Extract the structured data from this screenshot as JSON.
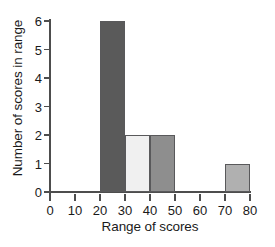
{
  "chart_data": {
    "type": "bar",
    "title": "",
    "xlabel": "Range of scores",
    "ylabel": "Number of scores in range",
    "xlim": [
      0,
      80
    ],
    "ylim": [
      0,
      6
    ],
    "grid": false,
    "legend": null,
    "xticks": [
      0,
      10,
      20,
      30,
      40,
      50,
      60,
      70,
      80
    ],
    "yticks": [
      0,
      1,
      2,
      3,
      4,
      5,
      6
    ],
    "bin_width": 10,
    "categories": [
      "0-10",
      "10-20",
      "20-30",
      "30-40",
      "40-50",
      "50-60",
      "60-70",
      "70-80"
    ],
    "values": [
      0,
      0,
      6,
      2,
      2,
      0,
      0,
      1
    ],
    "bars": [
      {
        "label": "20-30",
        "x0": 20,
        "x1": 30,
        "value": 6,
        "color": "#5a5a5a"
      },
      {
        "label": "30-40",
        "x0": 30,
        "x1": 40,
        "value": 2,
        "color": "#f0f0f0"
      },
      {
        "label": "40-50",
        "x0": 40,
        "x1": 50,
        "value": 2,
        "color": "#8e8e8e"
      },
      {
        "label": "70-80",
        "x0": 70,
        "x1": 80,
        "value": 1,
        "color": "#b0b0b0"
      }
    ],
    "bar_edge_color": "#59595b",
    "axis_color": "#4d4d4d",
    "text_color": "#1a1a1a",
    "background": "#ffffff"
  }
}
